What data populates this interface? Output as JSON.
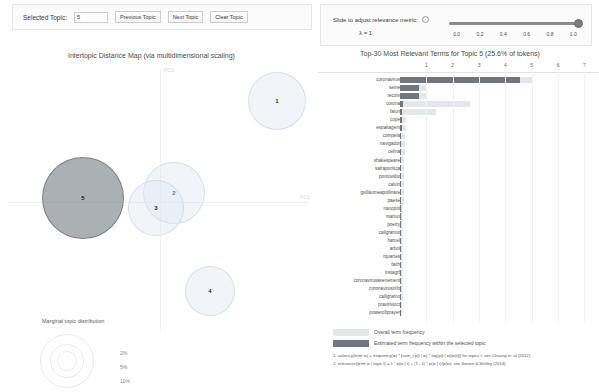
{
  "controls": {
    "selected_topic_label": "Selected Topic:",
    "selected_topic_value": "5",
    "previous_topic": "Previous Topic",
    "next_topic": "Next Topic",
    "clear_topic": "Clear Topic",
    "slider_caption": "Slide to adjust relevance metric:",
    "info_icon": "info-icon",
    "lambda_value": "λ = 1",
    "slider_ticks": [
      "0.0",
      "0.2",
      "0.4",
      "0.6",
      "0.8",
      "1.0"
    ],
    "slider_position_pct": 100
  },
  "left_panel": {
    "title": "Intertopic Distance Map (via multidimensional scaling)",
    "axis_x_label": "PC1",
    "axis_y_label": "PC2",
    "marginal_legend": {
      "title": "Marginal topic distribution",
      "sizes": [
        "2%",
        "5%",
        "10%"
      ]
    },
    "topics": [
      {
        "id": "5",
        "label": "5",
        "x": 42,
        "y": 95,
        "d": 82,
        "selected": true
      },
      {
        "id": "2",
        "label": "2",
        "x": 143,
        "y": 100,
        "d": 62,
        "selected": false
      },
      {
        "id": "3",
        "label": "3",
        "x": 128,
        "y": 118,
        "d": 56,
        "selected": false
      },
      {
        "id": "1",
        "label": "1",
        "x": 248,
        "y": 10,
        "d": 58,
        "selected": false
      },
      {
        "id": "4",
        "label": "4",
        "x": 185,
        "y": 204,
        "d": 50,
        "selected": false
      }
    ]
  },
  "right_panel": {
    "title": "Top-30 Most Relevant Terms for Topic 5 (25.6% of tokens)",
    "axis_ticks": [
      "1",
      "2",
      "3",
      "4",
      "5",
      "6",
      "7"
    ],
    "axis_max": 7.4,
    "legend": {
      "overall": "Overall term frequency",
      "within": "Estimated term frequency within the selected topic"
    },
    "footnotes": [
      "1. saliency(term w) = frequency(w) * [sum_t p(t | w) * log(p(t | w)/p(t))] for topics t; see Chuang et. al (2012)",
      "2. relevance(term w | topic t) = λ * p(w | t) + (1 - λ) * p(w | t)/p(w); see Sievert & Shirley (2014)"
    ]
  },
  "chart_data": {
    "type": "bar",
    "title": "Top-30 Most Relevant Terms for Topic 5 (25.6% of tokens)",
    "xlabel": "",
    "ylabel": "",
    "xlim": [
      0,
      7.4
    ],
    "grid": true,
    "legend_position": "bottom",
    "categories": [
      "coronavirus",
      "seine",
      "recoin",
      "corona",
      "falun",
      "cope",
      "espaltagem",
      "compela",
      "navigador",
      "celina",
      "shakespeare",
      "satrapontica",
      "pontovidio",
      "calvin",
      "guillaumeapollinare",
      "paese",
      "nanopot",
      "mariun",
      "poetry",
      "caligramto",
      "hamel",
      "arbol",
      "rquartes",
      "faith",
      "instagrf",
      "coronavirusavenement",
      "coronavirusinfo",
      "calligramo",
      "pravirivioct",
      "poweroftprayer"
    ],
    "series": [
      {
        "name": "Overall term frequency",
        "values": [
          5.05,
          0.98,
          0.98,
          2.66,
          1.35,
          0.22,
          0.22,
          0.2,
          0.19,
          0.18,
          0.17,
          0.16,
          0.15,
          0.15,
          0.14,
          0.14,
          0.13,
          0.13,
          0.12,
          0.12,
          0.12,
          0.11,
          0.11,
          0.11,
          0.1,
          0.1,
          0.1,
          0.1,
          0.09,
          0.09
        ]
      },
      {
        "name": "Estimated term frequency within the selected topic",
        "values": [
          4.55,
          0.72,
          0.72,
          0.12,
          0.07,
          0.06,
          0.06,
          0.05,
          0.05,
          0.05,
          0.05,
          0.05,
          0.05,
          0.04,
          0.04,
          0.04,
          0.04,
          0.04,
          0.04,
          0.04,
          0.04,
          0.04,
          0.04,
          0.03,
          0.03,
          0.03,
          0.03,
          0.03,
          0.03,
          0.03
        ]
      }
    ]
  },
  "colors": {
    "bar_overall": "#e3e6ea",
    "bar_within": "#6f7680",
    "topic_circle": "#dce6f0",
    "topic_selected": "#788088"
  }
}
